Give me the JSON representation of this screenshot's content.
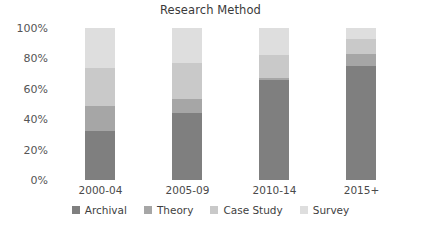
{
  "chart_data": {
    "type": "bar",
    "subtype": "stacked-bar-100-percent",
    "title": "Research Method",
    "xlabel": "",
    "ylabel": "",
    "categories": [
      "2000-04",
      "2005-09",
      "2010-14",
      "2015+"
    ],
    "series": [
      {
        "name": "Archival",
        "color": "#7f7f7f",
        "values": [
          32,
          44,
          66,
          75
        ]
      },
      {
        "name": "Theory",
        "color": "#a6a6a6",
        "values": [
          17,
          9,
          1,
          8
        ]
      },
      {
        "name": "Case Study",
        "color": "#c9c9c9",
        "values": [
          25,
          24,
          15,
          10
        ]
      },
      {
        "name": "Survey",
        "color": "#dedede",
        "values": [
          26,
          23,
          18,
          7
        ]
      }
    ],
    "ylim": [
      0,
      100
    ],
    "yticks": [
      0,
      20,
      40,
      60,
      80,
      100
    ],
    "ytick_labels": [
      "0%",
      "20%",
      "40%",
      "60%",
      "80%",
      "100%"
    ],
    "grid": false,
    "legend_position": "bottom",
    "stack_order_bottom_to_top": [
      "Archival",
      "Theory",
      "Case Study",
      "Survey"
    ],
    "units": "percent"
  },
  "legend": {
    "items": [
      {
        "label": "Archival"
      },
      {
        "label": "Theory"
      },
      {
        "label": "Case Study"
      },
      {
        "label": "Survey"
      }
    ]
  }
}
